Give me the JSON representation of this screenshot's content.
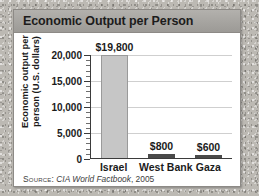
{
  "card": {
    "title": "Economic Output per Person"
  },
  "source": {
    "label": "Source:",
    "work": "CIA World Factbook",
    "year": ", 2005"
  },
  "colors": {
    "header_bar": "#a6a4a0",
    "card_background": "#ffffff",
    "card_border": "#8d8a86",
    "backdrop": "#bcb9b3",
    "bar_tall": "#c6c6c6",
    "bar_tall_border": "#9a9a9a",
    "bar_short": "#4a4a4a",
    "gridline": "#cfcfcf",
    "axis": "#3b3b3b",
    "text": "#1b1b1b"
  },
  "chart_data": {
    "type": "bar",
    "title": "Economic Output per Person",
    "categories": [
      "Israel",
      "West Bank",
      "Gaza"
    ],
    "values": [
      19800,
      800,
      600
    ],
    "value_labels": [
      "$19,800",
      "$800",
      "$600"
    ],
    "xlabel": "",
    "ylabel": "Economic output per person (U.S. dollars)",
    "ylabel_lines": [
      "Economic output per",
      "person (U.S. dollars)"
    ],
    "ylim": [
      0,
      20000
    ],
    "yticks": [
      0,
      5000,
      10000,
      15000,
      20000
    ],
    "ytick_labels": [
      "0",
      "5,000",
      "10,000",
      "15,000",
      "20,000"
    ],
    "minor_ticks_per_interval": 4,
    "grid": true,
    "legend": null,
    "source": "SOURCE: CIA World Factbook, 2005"
  }
}
